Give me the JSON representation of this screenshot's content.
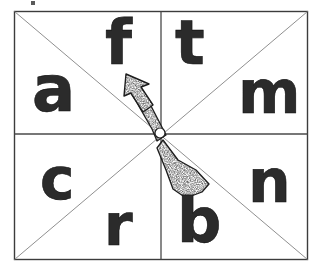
{
  "figure": {
    "kind": "spinner-diagram",
    "background_color": "#ffffff",
    "ink_color": "#1a1a1a",
    "line_color": "#4a4a4a",
    "diagonal_color": "#8a8a8a"
  },
  "board": {
    "name": "spinner-board",
    "x": 14,
    "y": 11,
    "width": 293,
    "height": 248,
    "border_color": "#3c3c3c",
    "divider_color": "#4a4a4a",
    "diagonal_color": "#909090"
  },
  "dividers": {
    "vertical_x": 161,
    "horizontal_y": 134
  },
  "quadrants": [
    {
      "name": "top-left",
      "letters": [
        "a",
        "f"
      ]
    },
    {
      "name": "top-right",
      "letters": [
        "t",
        "m"
      ]
    },
    {
      "name": "bottom-left",
      "letters": [
        "c",
        "r"
      ]
    },
    {
      "name": "bottom-right",
      "letters": [
        "b",
        "n"
      ]
    }
  ],
  "letters": [
    {
      "id": "letter-f",
      "char": "f",
      "x": 105,
      "y": 12,
      "size": 62,
      "rotate": 0,
      "quadrant": "top-left"
    },
    {
      "id": "letter-t",
      "char": "t",
      "x": 175,
      "y": 12,
      "size": 62,
      "rotate": 0,
      "quadrant": "top-right"
    },
    {
      "id": "letter-a",
      "char": "a",
      "x": 32,
      "y": 58,
      "size": 64,
      "rotate": 0,
      "quadrant": "top-left"
    },
    {
      "id": "letter-m",
      "char": "m",
      "x": 238,
      "y": 63,
      "size": 60,
      "rotate": 0,
      "quadrant": "top-right"
    },
    {
      "id": "letter-c",
      "char": "c",
      "x": 40,
      "y": 150,
      "size": 58,
      "rotate": 0,
      "quadrant": "bottom-left"
    },
    {
      "id": "letter-n",
      "char": "n",
      "x": 248,
      "y": 152,
      "size": 60,
      "rotate": 0,
      "quadrant": "bottom-right"
    },
    {
      "id": "letter-r",
      "char": "r",
      "x": 104,
      "y": 196,
      "size": 58,
      "rotate": 0,
      "quadrant": "bottom-left"
    },
    {
      "id": "letter-b",
      "char": "b",
      "x": 177,
      "y": 190,
      "size": 62,
      "rotate": 0,
      "quadrant": "bottom-right"
    }
  ],
  "pointer": {
    "name": "spinner-arrow",
    "pivot_x": 160,
    "pivot_y": 133,
    "tip_x": 129,
    "tip_y": 80,
    "tail_x": 190,
    "tail_y": 186,
    "direction": "up-left",
    "points_at": "f",
    "fill": "stippled",
    "pivot_fill": "#ffffff",
    "pivot_radius": 5
  },
  "artifact": {
    "name": "scan-speck",
    "x": 31,
    "y": 1,
    "width": 4,
    "height": 4,
    "color": "#5a5a5a"
  },
  "alphabet_sequence": [
    "a",
    "f",
    "t",
    "m",
    "c",
    "r",
    "b",
    "n"
  ]
}
